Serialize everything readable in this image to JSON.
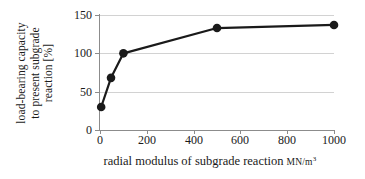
{
  "chart_data": {
    "type": "line",
    "title": "",
    "xlabel": "radial modulus of subgrade reaction",
    "xlabel_unit": "MN/m",
    "xlabel_unit_exponent": "3",
    "ylabel_lines": [
      "load-bearing capacity",
      "to present subgrade",
      "reaction [%]"
    ],
    "x": [
      5,
      47,
      100,
      500,
      1000
    ],
    "values": [
      30,
      68,
      100,
      133,
      137
    ],
    "xlim": [
      0,
      1000
    ],
    "ylim": [
      0,
      150
    ],
    "xticks": [
      0,
      200,
      400,
      600,
      800,
      1000
    ],
    "xtick_labels": [
      "0",
      "200",
      "400",
      "600",
      "800",
      "1000"
    ],
    "yticks": [
      0,
      50,
      100,
      150
    ],
    "ytick_labels": [
      "0",
      "50",
      "100",
      "150"
    ],
    "grid": "horizontal",
    "legend": "none",
    "series": [
      {
        "name": "load-bearing capacity",
        "x": [
          5,
          47,
          100,
          500,
          1000
        ],
        "values": [
          30,
          68,
          100,
          133,
          137
        ],
        "line_color": "#1a1a1a",
        "marker": "circle",
        "marker_color": "#1a1a1a"
      }
    ],
    "colors": {
      "line": "#1a1a1a",
      "marker": "#1a1a1a",
      "grid": "#d2d2d2",
      "axis": "#8c8c8c",
      "background": "#ffffff",
      "text": "#1a1a1a"
    }
  }
}
